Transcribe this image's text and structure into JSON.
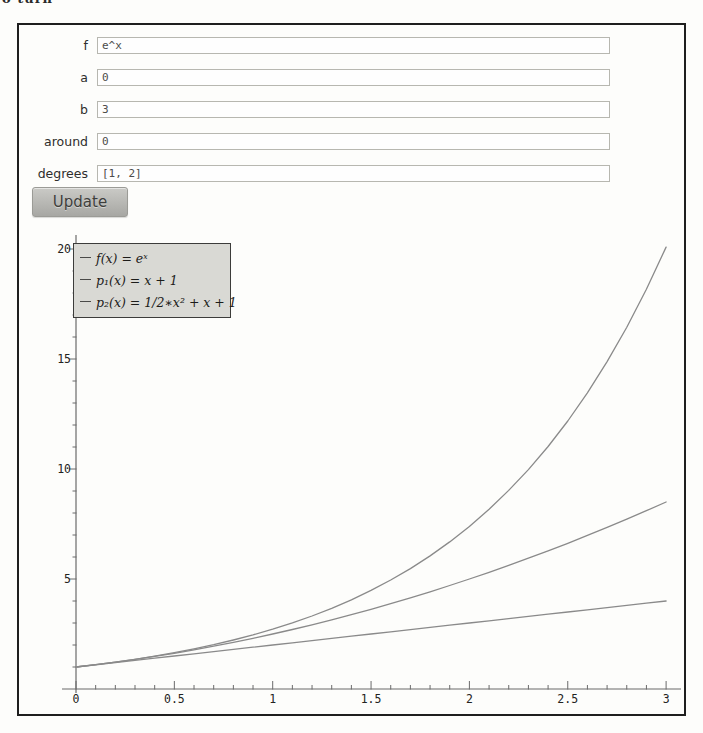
{
  "page": {
    "clipped_text_fragment": "o turn"
  },
  "form": {
    "fields": [
      {
        "label": "f",
        "value": "e^x"
      },
      {
        "label": "a",
        "value": "0"
      },
      {
        "label": "b",
        "value": "3"
      },
      {
        "label": "around",
        "value": "0"
      },
      {
        "label": "degrees",
        "value": "[1, 2]"
      }
    ],
    "update_label": "Update"
  },
  "chart_data": {
    "type": "line",
    "title": "",
    "xlabel": "",
    "ylabel": "",
    "xlim": [
      0,
      3
    ],
    "ylim": [
      0,
      20.5
    ],
    "grid": false,
    "legend_position": "top-left",
    "x_ticks": [
      0,
      0.5,
      1,
      1.5,
      2,
      2.5,
      3
    ],
    "x_tick_labels": [
      "0",
      "0.5",
      "1",
      "1.5",
      "2",
      "2.5",
      "3"
    ],
    "x_minor_step": 0.1,
    "y_ticks": [
      5,
      10,
      15,
      20
    ],
    "y_tick_labels": [
      "5",
      "10",
      "15",
      "20"
    ],
    "y_minor_step": 1,
    "x": [
      0,
      0.1,
      0.2,
      0.3,
      0.4,
      0.5,
      0.6,
      0.7,
      0.8,
      0.9,
      1,
      1.1,
      1.2,
      1.3,
      1.4,
      1.5,
      1.6,
      1.7,
      1.8,
      1.9,
      2,
      2.1,
      2.2,
      2.3,
      2.4,
      2.5,
      2.6,
      2.7,
      2.8,
      2.9,
      3
    ],
    "series": [
      {
        "name": "f",
        "legend_label": "f(x) = eˣ",
        "color": "#8a8a8a",
        "values": [
          1,
          1.105,
          1.221,
          1.35,
          1.492,
          1.649,
          1.822,
          2.014,
          2.226,
          2.46,
          2.718,
          3.004,
          3.32,
          3.669,
          4.055,
          4.482,
          4.953,
          5.474,
          6.05,
          6.686,
          7.389,
          8.166,
          9.025,
          9.974,
          11.023,
          12.182,
          13.464,
          14.88,
          16.445,
          18.174,
          20.086
        ]
      },
      {
        "name": "p1",
        "legend_label": "p₁(x) = x + 1",
        "color": "#8a8a8a",
        "values": [
          1,
          1.1,
          1.2,
          1.3,
          1.4,
          1.5,
          1.6,
          1.7,
          1.8,
          1.9,
          2,
          2.1,
          2.2,
          2.3,
          2.4,
          2.5,
          2.6,
          2.7,
          2.8,
          2.9,
          3,
          3.1,
          3.2,
          3.3,
          3.4,
          3.5,
          3.6,
          3.7,
          3.8,
          3.9,
          4
        ]
      },
      {
        "name": "p2",
        "legend_label": "p₂(x) = 1/2∗x² + x + 1",
        "color": "#8a8a8a",
        "values": [
          1,
          1.105,
          1.22,
          1.345,
          1.48,
          1.625,
          1.78,
          1.945,
          2.12,
          2.305,
          2.5,
          2.705,
          2.92,
          3.145,
          3.38,
          3.625,
          3.88,
          4.145,
          4.42,
          4.705,
          5,
          5.305,
          5.62,
          5.945,
          6.28,
          6.625,
          6.98,
          7.345,
          7.72,
          8.105,
          8.5
        ]
      }
    ]
  },
  "colors": {
    "frame_border": "#1e1e1e",
    "axis": "#6b6b6b",
    "tick_label": "#232321",
    "curve": "#8a8a8a",
    "legend_bg": "#d9d9d4",
    "legend_border": "#3c3c3a",
    "legend_dash": "#4a4a48",
    "button_text": "#3e3e3c"
  }
}
